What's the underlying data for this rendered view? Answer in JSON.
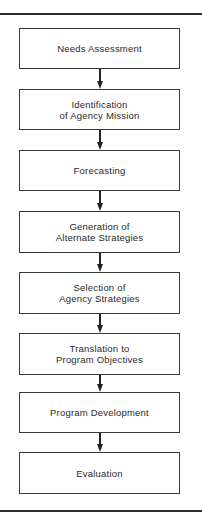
{
  "flowchart": {
    "steps": [
      {
        "label": "Needs Assessment"
      },
      {
        "label": "Identification\nof Agency Mission"
      },
      {
        "label": "Forecasting"
      },
      {
        "label": "Generation of\nAlternate Strategies"
      },
      {
        "label": "Selection of\nAgency Strategies"
      },
      {
        "label": "Translation to\nProgram Objectives"
      },
      {
        "label": "Program Development"
      },
      {
        "label": "Evaluation"
      }
    ],
    "connections": [
      {
        "from": 0,
        "to": 1
      },
      {
        "from": 1,
        "to": 2
      },
      {
        "from": 2,
        "to": 3
      },
      {
        "from": 3,
        "to": 4
      },
      {
        "from": 4,
        "to": 5
      },
      {
        "from": 5,
        "to": 6
      },
      {
        "from": 6,
        "to": 7
      }
    ]
  }
}
